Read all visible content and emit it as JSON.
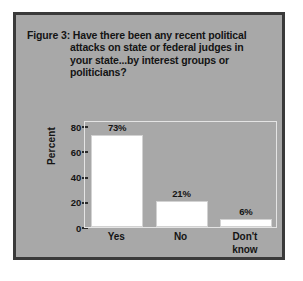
{
  "figure": {
    "title_lines": [
      "Figure 3: Have there been any recent political",
      "attacks on state or federal judges in",
      "your state...by interest groups or",
      "politicians?"
    ],
    "frame_color": "#3a3a3a",
    "background_color": "#a8a8a8",
    "bar_color": "#ffffff",
    "text_color": "#141414"
  },
  "chart_data": {
    "type": "bar",
    "title": "Figure 3: Have there been any recent political attacks on state or federal judges in your state...by interest groups or politicians?",
    "categories": [
      "Yes",
      "No",
      "Don't know"
    ],
    "category_lines": [
      [
        "Yes"
      ],
      [
        "No"
      ],
      [
        "Don't",
        "know"
      ]
    ],
    "values": [
      73,
      21,
      6
    ],
    "value_labels": [
      "73%",
      "21%",
      "6%"
    ],
    "xlabel": "",
    "ylabel": "Percent",
    "ylim": [
      0,
      85
    ],
    "yticks": [
      0,
      20,
      40,
      60,
      80
    ],
    "ytick_labels": [
      "0",
      "20",
      "40",
      "60",
      "80"
    ],
    "grid": false,
    "legend": false
  }
}
